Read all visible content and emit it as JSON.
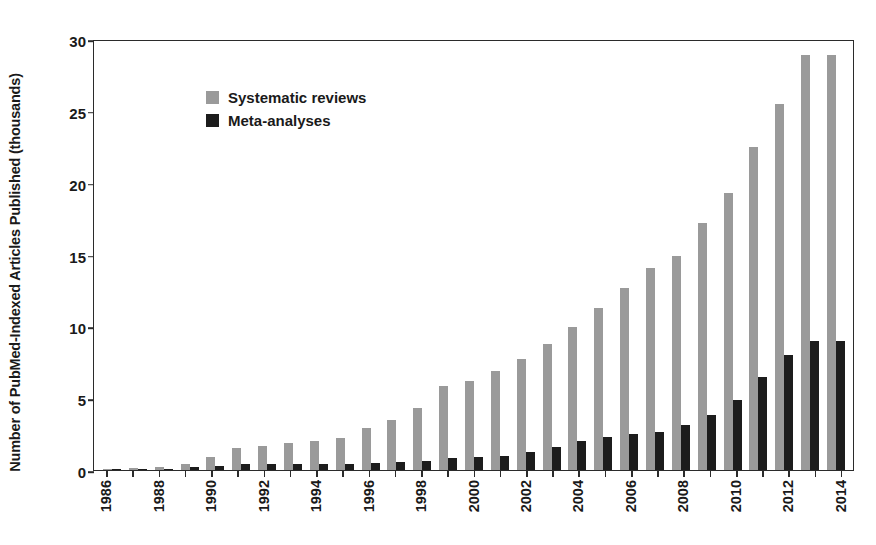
{
  "chart_data": {
    "type": "bar",
    "title": "",
    "subtitle": "",
    "xlabel": "",
    "ylabel": "Number of PubMed-Indexed Articles Published (thousands)",
    "categories": [
      "1986",
      "1987",
      "1988",
      "1989",
      "1990",
      "1991",
      "1992",
      "1993",
      "1994",
      "1995",
      "1996",
      "1997",
      "1998",
      "1999",
      "2000",
      "2001",
      "2002",
      "2003",
      "2004",
      "2005",
      "2006",
      "2007",
      "2008",
      "2009",
      "2010",
      "2011",
      "2012",
      "2013",
      "2014"
    ],
    "xtick_labels": [
      "1986",
      "",
      "1988",
      "",
      "1990",
      "",
      "1992",
      "",
      "1994",
      "",
      "1996",
      "",
      "1998",
      "",
      "2000",
      "",
      "2002",
      "",
      "2004",
      "",
      "2006",
      "",
      "2008",
      "",
      "2010",
      "",
      "2012",
      "",
      "2014"
    ],
    "xtick_rotation": 90,
    "ylim": [
      0,
      30
    ],
    "yticks": [
      0,
      5,
      10,
      15,
      20,
      25,
      30
    ],
    "ytick_labels": [
      "0",
      "5",
      "10",
      "15",
      "20",
      "25",
      "30"
    ],
    "grid": false,
    "legend_position": "top-left",
    "series": [
      {
        "name": "Systematic reviews",
        "color": "#9a9a9a",
        "values": [
          0.1,
          0.15,
          0.2,
          0.4,
          0.9,
          1.5,
          1.7,
          1.9,
          2.0,
          2.25,
          2.95,
          3.5,
          4.35,
          5.85,
          6.2,
          6.9,
          7.75,
          8.75,
          9.95,
          11.3,
          12.65,
          14.05,
          14.9,
          17.2,
          19.3,
          22.5,
          25.5,
          28.9,
          28.9
        ]
      },
      {
        "name": "Meta-analyses",
        "color": "#1c1c1c",
        "values": [
          0.05,
          0.08,
          0.1,
          0.2,
          0.3,
          0.4,
          0.4,
          0.4,
          0.45,
          0.45,
          0.5,
          0.55,
          0.65,
          0.85,
          0.9,
          0.95,
          1.25,
          1.6,
          2.0,
          2.3,
          2.5,
          2.65,
          3.1,
          3.8,
          4.85,
          6.5,
          8.0,
          9.0,
          9.0
        ]
      }
    ]
  },
  "legend": {
    "items": [
      {
        "label": "Systematic reviews",
        "color": "#9a9a9a"
      },
      {
        "label": "Meta-analyses",
        "color": "#1c1c1c"
      }
    ]
  }
}
